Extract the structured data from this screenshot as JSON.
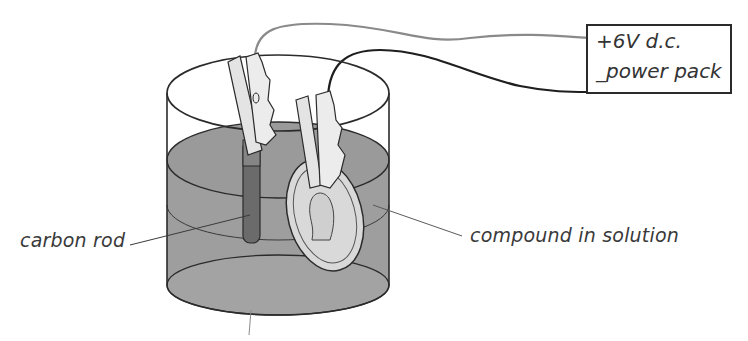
{
  "diagram": {
    "power_pack": {
      "line1": "+6V d.c.",
      "line2": "_power pack",
      "positive_terminal": "+",
      "negative_terminal": "_",
      "voltage": "6V",
      "type": "d.c."
    },
    "labels": {
      "carbon_rod": "carbon rod",
      "compound": "compound in solution"
    },
    "components": [
      "beaker",
      "carbon rod",
      "coin electrode",
      "crocodile clips",
      "wires",
      "power pack"
    ],
    "colors": {
      "outline": "#2b2b2b",
      "liquid": "#9e9e9e",
      "liquid_dark": "#8f8f8f",
      "carbon_rod": "#6b6b6b",
      "clip": "#e4e4e4",
      "coin": "#d9d9d9",
      "wire_positive": "#8a8a8a",
      "wire_negative": "#1e1e1e"
    }
  }
}
